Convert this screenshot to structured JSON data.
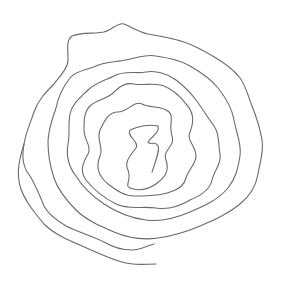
{
  "image": {
    "subject": "hand-drawn spiral",
    "background": "#ffffff",
    "stroke_color": "#6a6a6a"
  }
}
